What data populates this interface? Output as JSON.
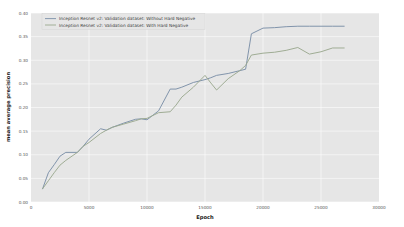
{
  "chart_data": {
    "type": "line",
    "title": "",
    "xlabel": "Epoch",
    "ylabel": "mean average precision",
    "xlim": [
      0,
      30000
    ],
    "ylim": [
      0.0,
      0.4
    ],
    "xticks": [
      0,
      5000,
      10000,
      15000,
      20000,
      25000,
      30000
    ],
    "xtick_labels": [
      "0",
      "5000",
      "10000",
      "15000",
      "20000",
      "25000",
      "30000"
    ],
    "yticks": [
      0.0,
      0.05,
      0.1,
      0.15,
      0.2,
      0.25,
      0.3,
      0.35,
      0.4
    ],
    "ytick_labels": [
      "0.00",
      "0.05",
      "0.10",
      "0.15",
      "0.20",
      "0.25",
      "0.30",
      "0.35",
      "0.40"
    ],
    "grid": true,
    "legend_position": "upper left",
    "plot_bgcolor": "#e6e6e6",
    "grid_color": "#ffffff",
    "series": [
      {
        "name": "Inception Resnet v2: Validation dataset: Without Hard Negative",
        "color": "#7b8fa8",
        "x": [
          1000,
          1500,
          2000,
          2500,
          3000,
          4000,
          4500,
          5000,
          6000,
          6500,
          7000,
          8000,
          9000,
          9500,
          10000,
          11000,
          12000,
          12500,
          13000,
          14000,
          15000,
          15500,
          16000,
          17000,
          18000,
          18500,
          19000,
          20000,
          21000,
          22000,
          23000,
          24000,
          25000,
          26000,
          27000
        ],
        "y": [
          0.028,
          0.062,
          0.079,
          0.097,
          0.105,
          0.105,
          0.118,
          0.133,
          0.155,
          0.152,
          0.158,
          0.167,
          0.175,
          0.176,
          0.174,
          0.193,
          0.239,
          0.239,
          0.243,
          0.253,
          0.259,
          0.263,
          0.268,
          0.272,
          0.278,
          0.281,
          0.356,
          0.368,
          0.369,
          0.371,
          0.372,
          0.372,
          0.372,
          0.372,
          0.372
        ]
      },
      {
        "name": "Inception Resnet v2: Validation dataset: With Hard Negative",
        "color": "#9ba98f",
        "x": [
          1000,
          1500,
          2000,
          2500,
          3000,
          4000,
          4500,
          5000,
          6000,
          6500,
          7000,
          8000,
          9000,
          9500,
          10000,
          11000,
          12000,
          12500,
          13000,
          14000,
          15000,
          15500,
          16000,
          17000,
          18000,
          18500,
          19000,
          20000,
          21000,
          22000,
          23000,
          24000,
          25000,
          26000,
          27000
        ],
        "y": [
          0.028,
          0.045,
          0.062,
          0.078,
          0.088,
          0.105,
          0.118,
          0.126,
          0.145,
          0.152,
          0.158,
          0.165,
          0.172,
          0.176,
          0.177,
          0.189,
          0.191,
          0.205,
          0.222,
          0.243,
          0.268,
          0.252,
          0.237,
          0.261,
          0.278,
          0.289,
          0.311,
          0.315,
          0.317,
          0.321,
          0.327,
          0.313,
          0.318,
          0.326,
          0.326
        ]
      }
    ]
  },
  "legend": {
    "entries": [
      {
        "label": "Inception Resnet v2: Validation dataset: Without Hard Negative"
      },
      {
        "label": "Inception Resnet v2: Validation dataset: With Hard Negative"
      }
    ]
  },
  "axes": {
    "xlabel": "Epoch",
    "ylabel": "mean average precision"
  }
}
